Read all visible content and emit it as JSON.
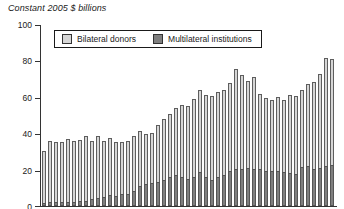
{
  "colors": {
    "background": "#ffffff",
    "bilateral": "#d6d6d6",
    "multilateral": "#7f7f7f",
    "bar_border": "#5e5e5e",
    "axis": "#333333",
    "text": "#1a1a1a"
  },
  "chart_data": {
    "type": "bar",
    "stacked": true,
    "title": "Constant 2005 $ billions",
    "xlabel": "",
    "ylabel": "",
    "ylim": [
      0,
      100
    ],
    "yticks": [
      0,
      20,
      40,
      60,
      80,
      100
    ],
    "grid": false,
    "legend_position": "top-left inside plot, horizontal, boxed",
    "x_tick_labels_visible": false,
    "stack_order_bottom_to_top": [
      "Multilateral institutions",
      "Bilateral donors"
    ],
    "series": [
      {
        "name": "Bilateral donors",
        "color": "#d6d6d6",
        "values": [
          28.5,
          33.5,
          33,
          33,
          35,
          33.5,
          33.5,
          35.5,
          31.5,
          34,
          30.5,
          31.5,
          29.5,
          28.5,
          29,
          30.5,
          30,
          27.5,
          27.5,
          31.5,
          33.5,
          34.5,
          37,
          39.5,
          40,
          43,
          45,
          45,
          46,
          46.5,
          47,
          48,
          54.5,
          51.5,
          47.5,
          50.5,
          41,
          40,
          39,
          40.5,
          40,
          43,
          43,
          42.5,
          45,
          47.5,
          51.5,
          59.5,
          58
        ]
      },
      {
        "name": "Multilateral institutions",
        "color": "#7f7f7f",
        "values": [
          1.5,
          2,
          2,
          2,
          2,
          2,
          2.5,
          3,
          4,
          4.5,
          5,
          6,
          5.5,
          6.5,
          6.5,
          8,
          11,
          12,
          12.5,
          13,
          14.5,
          16,
          17,
          16,
          15,
          16,
          18.5,
          16,
          14.5,
          16,
          17,
          19.5,
          20.5,
          20.5,
          21,
          20.5,
          20.5,
          19.5,
          19,
          19.5,
          18.5,
          18,
          17.5,
          21.5,
          22,
          20.5,
          21,
          22,
          22.5
        ]
      }
    ]
  }
}
